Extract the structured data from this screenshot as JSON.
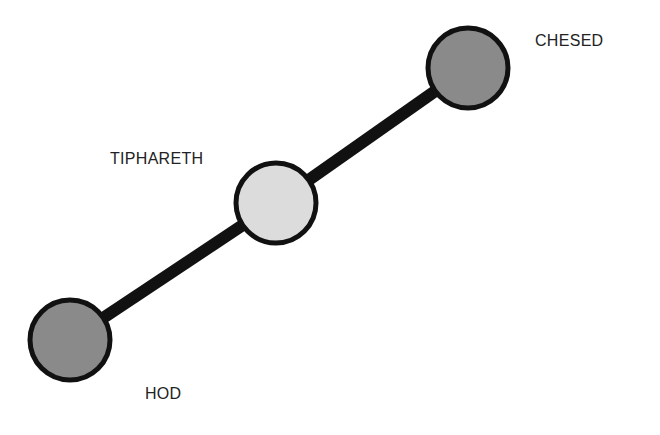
{
  "diagram": {
    "nodes": [
      {
        "id": "chesed",
        "label": "CHESED",
        "fill": "#8a8a8a"
      },
      {
        "id": "tiphareth",
        "label": "TIPHARETH",
        "fill": "#dcdcdc"
      },
      {
        "id": "hod",
        "label": "HOD",
        "fill": "#8a8a8a"
      }
    ],
    "edges": [
      {
        "from": "hod",
        "to": "tiphareth"
      },
      {
        "from": "tiphareth",
        "to": "chesed"
      }
    ]
  }
}
